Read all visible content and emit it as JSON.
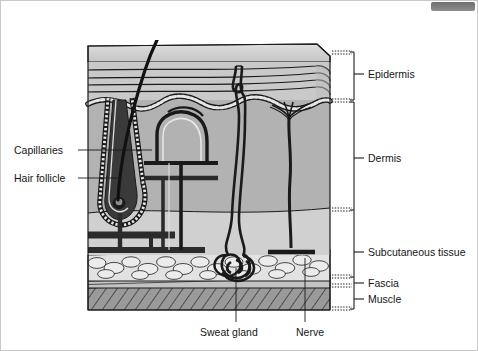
{
  "figure": {
    "type": "anatomical-cross-section",
    "background_color": "#ffffff",
    "line_color": "#1a1a1a"
  },
  "layers": [
    {
      "id": "epidermis",
      "label": "Epidermis",
      "fill": "#c9c9c9",
      "order": 1
    },
    {
      "id": "dermis",
      "label": "Dermis",
      "fill": "#b2b2b2",
      "order": 2
    },
    {
      "id": "subcutaneous",
      "label": "Subcutaneous tissue",
      "fill": "#dcdcdc",
      "order": 3
    },
    {
      "id": "fascia",
      "label": "Fascia",
      "fill": "#bdbdbd",
      "order": 4
    },
    {
      "id": "muscle",
      "label": "Muscle",
      "fill": "#9a9a9a",
      "order": 5
    }
  ],
  "right_labels": [
    {
      "key": "epidermis",
      "text": "Epidermis",
      "x": 368,
      "y": 73
    },
    {
      "key": "dermis",
      "text": "Dermis",
      "x": 368,
      "y": 158
    },
    {
      "key": "subcutaneous",
      "text": "Subcutaneous tissue",
      "x": 368,
      "y": 252
    },
    {
      "key": "fascia",
      "text": "Fascia",
      "x": 368,
      "y": 283
    },
    {
      "key": "muscle",
      "text": "Muscle",
      "x": 368,
      "y": 300
    }
  ],
  "left_labels": [
    {
      "key": "capillaries",
      "text": "Capillaries",
      "x": 14,
      "y": 144
    },
    {
      "key": "hair-follicle",
      "text": "Hair follicle",
      "x": 14,
      "y": 172
    }
  ],
  "bottom_labels": [
    {
      "key": "sweat-gland",
      "text": "Sweat gland",
      "x": 200,
      "y": 332
    },
    {
      "key": "nerve",
      "text": "Nerve",
      "x": 296,
      "y": 332
    }
  ],
  "structures": [
    {
      "key": "hair-shaft",
      "name": "hair shaft"
    },
    {
      "key": "hair-follicle",
      "name": "hair follicle"
    },
    {
      "key": "capillary-loop",
      "name": "capillary loop"
    },
    {
      "key": "artery",
      "name": "artery"
    },
    {
      "key": "vein",
      "name": "vein"
    },
    {
      "key": "sweat-duct",
      "name": "sweat duct"
    },
    {
      "key": "sweat-gland-coil",
      "name": "sweat gland coil"
    },
    {
      "key": "nerve-fiber",
      "name": "nerve fiber"
    },
    {
      "key": "adipose-cells",
      "name": "adipose cells"
    }
  ]
}
